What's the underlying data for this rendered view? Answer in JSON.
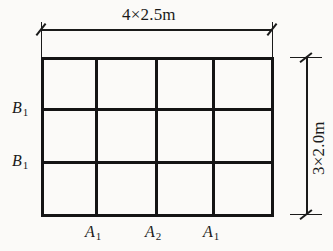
{
  "drawing": {
    "type": "structural-grid-plan",
    "background_color": "#fbfaf8",
    "line_color": "#141414",
    "columns": 4,
    "rows": 3
  },
  "dimensions": {
    "top": {
      "text": "4×2.5m",
      "count": 4,
      "spacing_m": 2.5,
      "total_m": 10.0,
      "orientation": "horizontal"
    },
    "right": {
      "text": "3×2.0m",
      "count": 3,
      "spacing_m": 2.0,
      "total_m": 6.0,
      "orientation": "vertical"
    }
  },
  "beam_labels_left": [
    {
      "name": "B",
      "sub": "1"
    },
    {
      "name": "B",
      "sub": "1"
    }
  ],
  "beam_labels_bottom": [
    {
      "name": "A",
      "sub": "1"
    },
    {
      "name": "A",
      "sub": "2"
    },
    {
      "name": "A",
      "sub": "1"
    }
  ]
}
